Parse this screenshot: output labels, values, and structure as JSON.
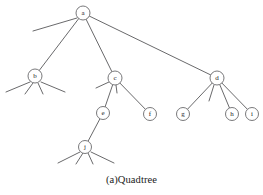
{
  "figure": {
    "caption": "(a)Quadtree",
    "title": "Quadtree",
    "label": "(a)"
  },
  "style": {
    "background_color": "#ffffff",
    "edge_color": "#58585a",
    "node_stroke_color": "#6a6a6c",
    "node_fill_color": "#ffffff",
    "label_color": "#1a1a1a"
  },
  "chart_data": {
    "type": "diagram",
    "diagram_kind": "quadtree",
    "title": "(a)Quadtree",
    "nodes": [
      {
        "id": "a",
        "label": "a",
        "x": 83,
        "y": 13,
        "r": 7.0,
        "depth": 0,
        "children": [
          "b",
          "c",
          "d"
        ],
        "leaf_stubs": 1
      },
      {
        "id": "b",
        "label": "b",
        "x": 35,
        "y": 76,
        "r": 7.0,
        "depth": 1,
        "children": [],
        "leaf_stubs": 4
      },
      {
        "id": "c",
        "label": "c",
        "x": 115,
        "y": 78,
        "r": 7.0,
        "depth": 1,
        "children": [
          "e",
          "f"
        ],
        "leaf_stubs": 2
      },
      {
        "id": "d",
        "label": "d",
        "x": 217,
        "y": 78,
        "r": 7.0,
        "depth": 1,
        "children": [
          "g",
          "h",
          "i"
        ],
        "leaf_stubs": 1
      },
      {
        "id": "e",
        "label": "e",
        "x": 103,
        "y": 113,
        "r": 6.5,
        "depth": 2,
        "children": [
          "j"
        ],
        "leaf_stubs": 0
      },
      {
        "id": "f",
        "label": "f",
        "x": 150,
        "y": 114,
        "r": 6.5,
        "depth": 2,
        "children": [],
        "leaf_stubs": 0
      },
      {
        "id": "g",
        "label": "g",
        "x": 183,
        "y": 114,
        "r": 6.5,
        "depth": 2,
        "children": [],
        "leaf_stubs": 0
      },
      {
        "id": "h",
        "label": "h",
        "x": 232,
        "y": 114,
        "r": 6.5,
        "depth": 2,
        "children": [],
        "leaf_stubs": 0
      },
      {
        "id": "i",
        "label": "i",
        "x": 252,
        "y": 114,
        "r": 6.5,
        "depth": 2,
        "children": [],
        "leaf_stubs": 0
      },
      {
        "id": "j",
        "label": "j",
        "x": 85,
        "y": 147,
        "r": 6.5,
        "depth": 3,
        "children": [],
        "leaf_stubs": 4
      }
    ],
    "edges": [
      {
        "from": "a",
        "to": "b"
      },
      {
        "from": "a",
        "to": "c"
      },
      {
        "from": "a",
        "to": "d"
      },
      {
        "from": "c",
        "to": "e"
      },
      {
        "from": "c",
        "to": "f"
      },
      {
        "from": "d",
        "to": "g"
      },
      {
        "from": "d",
        "to": "h"
      },
      {
        "from": "d",
        "to": "i"
      },
      {
        "from": "e",
        "to": "j"
      }
    ],
    "leaf_stub_lines": [
      {
        "parent": "a",
        "x1": 77,
        "y1": 18,
        "x2": 33,
        "y2": 31
      },
      {
        "parent": "b",
        "x1": 30,
        "y1": 82,
        "x2": 6,
        "y2": 92
      },
      {
        "parent": "b",
        "x1": 33,
        "y1": 83,
        "x2": 25,
        "y2": 94
      },
      {
        "parent": "b",
        "x1": 38,
        "y1": 83,
        "x2": 43,
        "y2": 94
      },
      {
        "parent": "b",
        "x1": 41,
        "y1": 82,
        "x2": 65,
        "y2": 92
      },
      {
        "parent": "c",
        "x1": 109,
        "y1": 82,
        "x2": 96,
        "y2": 88
      },
      {
        "parent": "c",
        "x1": 116,
        "y1": 85,
        "x2": 117,
        "y2": 93
      },
      {
        "parent": "d",
        "x1": 214,
        "y1": 85,
        "x2": 209,
        "y2": 101
      },
      {
        "parent": "j",
        "x1": 80,
        "y1": 152,
        "x2": 58,
        "y2": 163
      },
      {
        "parent": "j",
        "x1": 83,
        "y1": 153,
        "x2": 76,
        "y2": 164
      },
      {
        "parent": "j",
        "x1": 88,
        "y1": 153,
        "x2": 93,
        "y2": 164
      },
      {
        "parent": "j",
        "x1": 91,
        "y1": 152,
        "x2": 114,
        "y2": 163
      }
    ]
  }
}
